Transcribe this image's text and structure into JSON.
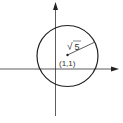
{
  "diagram": {
    "type": "coordinate-circle",
    "colors": {
      "line": "#222222",
      "text": "#333333",
      "background": "#ffffff"
    },
    "axes": {
      "x_axis": true,
      "y_axis": true,
      "arrows": true
    },
    "circle": {
      "center": [
        1,
        1
      ],
      "radius_label": "5",
      "radius_symbol": "√"
    },
    "labels": {
      "center": "(1,1)",
      "radius_root": "√",
      "radius_value": "5"
    }
  }
}
